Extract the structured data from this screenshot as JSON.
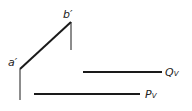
{
  "diagram": {
    "type": "descriptive-geometry-projection",
    "stroke_color": "#1a1a1a",
    "points": {
      "a_prime": {
        "label": "a′",
        "x": 20,
        "y": 69
      },
      "b_prime": {
        "label": "b′",
        "x": 71,
        "y": 22
      }
    },
    "lines": {
      "ab": {
        "label": "a′b′",
        "x1": 20,
        "y1": 69,
        "x2": 71,
        "y2": 22,
        "width": 2
      },
      "b_drop": {
        "x1": 71,
        "y1": 22,
        "x2": 71,
        "y2": 50,
        "width": 1
      },
      "a_drop": {
        "x1": 20,
        "y1": 69,
        "x2": 20,
        "y2": 100,
        "width": 1
      },
      "qv": {
        "label_main": "Q",
        "label_sub": "V",
        "x1": 83,
        "y1": 72,
        "x2": 162,
        "y2": 72,
        "width": 2
      },
      "pv": {
        "label_main": "P",
        "label_sub": "V",
        "x1": 34,
        "y1": 94,
        "x2": 140,
        "y2": 94,
        "width": 2
      }
    }
  }
}
